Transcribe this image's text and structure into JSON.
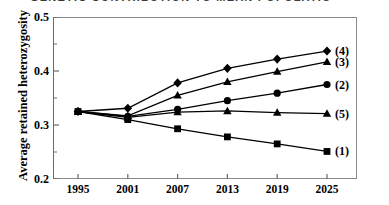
{
  "title_sliver": "GENETIC CONTRIBUTION TO MEAN POPULATION",
  "chart_data": {
    "type": "line",
    "title": "",
    "xlabel": "",
    "ylabel": "Average retained heterozygosity",
    "x": [
      1995,
      2001,
      2007,
      2013,
      2019,
      2025
    ],
    "categories": [
      "1995",
      "2001",
      "2007",
      "2013",
      "2019",
      "2025"
    ],
    "xticklabels": [
      "1995",
      "2001",
      "2007",
      "2013",
      "2019",
      "2025"
    ],
    "yticklabels": [
      "0.5",
      "0.4",
      "0.3",
      "0.2"
    ],
    "ylim": [
      0.2,
      0.5
    ],
    "ytick_values": [
      0.2,
      0.3,
      0.4,
      0.5
    ],
    "yminor_ticks": [
      0.25,
      0.35,
      0.45
    ],
    "grid": false,
    "legend_position": "right-inline",
    "series": [
      {
        "name": "(4)",
        "marker": "diamond",
        "values": [
          0.325,
          0.331,
          0.378,
          0.405,
          0.422,
          0.437
        ]
      },
      {
        "name": "(3)",
        "marker": "triangle",
        "values": [
          0.325,
          0.317,
          0.355,
          0.38,
          0.399,
          0.417
        ]
      },
      {
        "name": "(2)",
        "marker": "circle",
        "values": [
          0.325,
          0.316,
          0.329,
          0.345,
          0.359,
          0.375
        ]
      },
      {
        "name": "(5)",
        "marker": "triangle",
        "values": [
          0.325,
          0.314,
          0.324,
          0.326,
          0.323,
          0.321
        ]
      },
      {
        "name": "(1)",
        "marker": "square",
        "values": [
          0.325,
          0.31,
          0.293,
          0.278,
          0.265,
          0.251
        ]
      }
    ],
    "colors": {
      "line": "#000000",
      "marker": "#000000",
      "frame": "#8a8a8a",
      "background": "#ffffff"
    }
  }
}
